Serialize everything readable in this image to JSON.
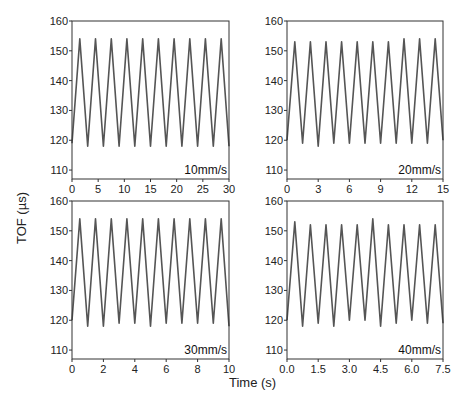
{
  "chart_data": [
    {
      "type": "line",
      "title": "10mm/s",
      "xlabel": "Time (s)",
      "ylabel": "TOF (µs)",
      "xlim": [
        0,
        30
      ],
      "ylim": [
        107,
        160
      ],
      "xticks": [
        0,
        5,
        10,
        15,
        20,
        25,
        30
      ],
      "yticks": [
        110,
        120,
        130,
        140,
        150,
        160
      ],
      "annotation": "10mm/s",
      "period": 3.0,
      "peaks": 10,
      "max": 154,
      "min": 118,
      "series": [
        {
          "name": "TOF",
          "x": [
            0,
            1.5,
            3,
            4.5,
            6,
            7.5,
            9,
            10.5,
            12,
            13.5,
            15,
            16.5,
            18,
            19.5,
            21,
            22.5,
            24,
            25.5,
            27,
            28.5,
            30
          ],
          "values": [
            119,
            154,
            118,
            154,
            118,
            154,
            118,
            154,
            118,
            154,
            118,
            154,
            118,
            154,
            118,
            154,
            118,
            154,
            118,
            154,
            118
          ]
        }
      ]
    },
    {
      "type": "line",
      "title": "20mm/s",
      "xlim": [
        0,
        15
      ],
      "ylim": [
        107,
        160
      ],
      "xticks": [
        0,
        3,
        6,
        9,
        12,
        15
      ],
      "yticks": [
        110,
        120,
        130,
        140,
        150,
        160
      ],
      "annotation": "20mm/s",
      "series": [
        {
          "name": "TOF",
          "x": [
            0,
            0.75,
            1.5,
            2.25,
            3,
            3.75,
            4.5,
            5.25,
            6,
            6.75,
            7.5,
            8.25,
            9,
            9.75,
            10.5,
            11.25,
            12,
            12.75,
            13.5,
            14.25,
            15
          ],
          "values": [
            120,
            153,
            119,
            153,
            118,
            153,
            119,
            153,
            119,
            153,
            119,
            153,
            119,
            153,
            119,
            154,
            119,
            154,
            119,
            154,
            120
          ]
        }
      ]
    },
    {
      "type": "line",
      "title": "30mm/s",
      "xlim": [
        0,
        10
      ],
      "ylim": [
        107,
        160
      ],
      "xticks": [
        0,
        2,
        4,
        6,
        8,
        10
      ],
      "yticks": [
        110,
        120,
        130,
        140,
        150,
        160
      ],
      "annotation": "30mm/s",
      "series": [
        {
          "name": "TOF",
          "x": [
            0,
            0.5,
            1,
            1.5,
            2,
            2.5,
            3,
            3.5,
            4,
            4.5,
            5,
            5.5,
            6,
            6.5,
            7,
            7.5,
            8,
            8.5,
            9,
            9.5,
            10
          ],
          "values": [
            120,
            154,
            118,
            154,
            118,
            154,
            119,
            154,
            119,
            154,
            118,
            154,
            119,
            154,
            119,
            154,
            119,
            154,
            119,
            154,
            118
          ]
        }
      ]
    },
    {
      "type": "line",
      "title": "40mm/s",
      "xlim": [
        0,
        7.5
      ],
      "ylim": [
        107,
        160
      ],
      "xticks": [
        "0.0",
        "1.5",
        "3.0",
        "4.5",
        "6.0",
        "7.5"
      ],
      "yticks": [
        110,
        120,
        130,
        140,
        150,
        160
      ],
      "annotation": "40mm/s",
      "series": [
        {
          "name": "TOF",
          "x": [
            0,
            0.375,
            0.75,
            1.125,
            1.5,
            1.875,
            2.25,
            2.625,
            3,
            3.375,
            3.75,
            4.125,
            4.5,
            4.875,
            5.25,
            5.625,
            6,
            6.375,
            6.75,
            7.125,
            7.5
          ],
          "values": [
            120,
            153,
            118,
            152,
            119,
            152,
            118,
            152,
            120,
            152,
            120,
            154,
            118,
            152,
            119,
            152,
            120,
            152,
            119,
            152,
            119
          ]
        }
      ]
    }
  ],
  "labels": {
    "ylabel": "TOF (µs)",
    "xlabel": "Time (s)",
    "panels": [
      "10mm/s",
      "20mm/s",
      "30mm/s",
      "40mm/s"
    ]
  },
  "colors": {
    "line": "#555555",
    "axis": "#333333",
    "text": "#222222"
  }
}
